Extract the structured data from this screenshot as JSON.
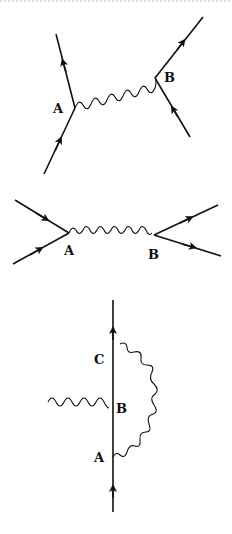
{
  "diagrams": [
    {
      "id": "exchange-diagram",
      "vertices": {
        "a_label": "A",
        "b_label": "B"
      }
    },
    {
      "id": "annihilation-diagram",
      "vertices": {
        "a_label": "A",
        "b_label": "B"
      }
    },
    {
      "id": "vertex-correction-diagram",
      "vertices": {
        "a_label": "A",
        "b_label": "B",
        "c_label": "C"
      }
    }
  ],
  "colors": {
    "ink": "#111111",
    "background": "#ffffff"
  }
}
